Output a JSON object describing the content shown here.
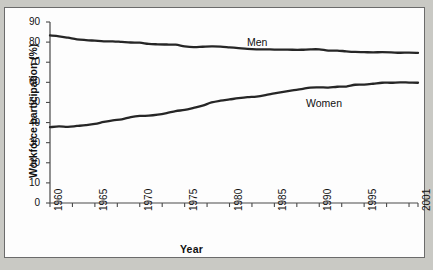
{
  "figure": {
    "background_color": "#c9c9c4",
    "panel_color": "#fdfdfd",
    "frame_color": "#6b6b6b",
    "line_color": "#262626"
  },
  "chart_data": {
    "type": "line",
    "title": "",
    "xlabel": "Year",
    "ylabel": "Workforce participation (%)",
    "xlim": [
      1960,
      2001
    ],
    "ylim": [
      0,
      90
    ],
    "grid": false,
    "legend": "inline-labels",
    "yticks": [
      0,
      10,
      20,
      30,
      40,
      50,
      60,
      70,
      80,
      90
    ],
    "ytick_labels": [
      "0",
      "10",
      "20",
      "30",
      "40",
      "50",
      "60",
      "70",
      "80",
      "90"
    ],
    "xticks": [
      1960,
      1965,
      1970,
      1975,
      1980,
      1985,
      1990,
      1995,
      2001
    ],
    "xtick_labels": [
      "1960",
      "1965",
      "1970",
      "1975",
      "1980",
      "1985",
      "1990",
      "1995",
      "2001"
    ],
    "minor_xtick_interval": 2.5,
    "x": [
      1960,
      1961,
      1962,
      1963,
      1964,
      1965,
      1966,
      1967,
      1968,
      1969,
      1970,
      1971,
      1972,
      1973,
      1974,
      1975,
      1976,
      1977,
      1978,
      1979,
      1980,
      1981,
      1982,
      1983,
      1984,
      1985,
      1986,
      1987,
      1988,
      1989,
      1990,
      1991,
      1992,
      1993,
      1994,
      1995,
      1996,
      1997,
      1998,
      1999,
      2000,
      2001
    ],
    "series": [
      {
        "name": "Men",
        "label_text": "Men",
        "values": [
          83.3,
          82.9,
          82.2,
          81.4,
          81.0,
          80.7,
          80.4,
          80.4,
          80.1,
          79.8,
          79.7,
          79.1,
          78.9,
          78.8,
          78.7,
          77.9,
          77.5,
          77.7,
          77.9,
          77.8,
          77.4,
          77.0,
          76.6,
          76.4,
          76.4,
          76.3,
          76.3,
          76.2,
          76.2,
          76.4,
          76.4,
          75.8,
          75.8,
          75.4,
          75.1,
          75.0,
          74.9,
          75.0,
          74.9,
          74.7,
          74.8,
          74.6
        ],
        "direction": "declining"
      },
      {
        "name": "Women",
        "label_text": "Women",
        "values": [
          37.7,
          38.1,
          37.9,
          38.3,
          38.7,
          39.3,
          40.3,
          41.1,
          41.6,
          42.7,
          43.3,
          43.4,
          43.9,
          44.7,
          45.7,
          46.3,
          47.3,
          48.4,
          50.0,
          50.9,
          51.5,
          52.1,
          52.6,
          52.9,
          53.6,
          54.5,
          55.3,
          56.0,
          56.6,
          57.4,
          57.5,
          57.4,
          57.8,
          57.9,
          58.8,
          58.9,
          59.3,
          59.8,
          59.8,
          60.0,
          59.9,
          59.8
        ],
        "direction": "rising"
      }
    ]
  }
}
